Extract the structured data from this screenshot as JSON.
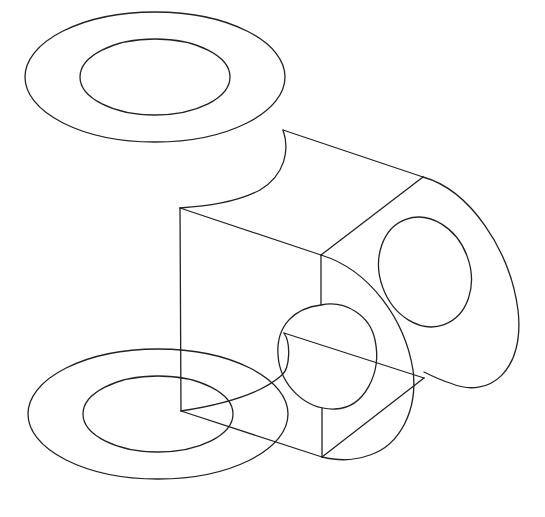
{
  "figure": {
    "type": "isometric-line-drawing",
    "background": "#ffffff",
    "stroke": "#222222"
  },
  "parts": {
    "top_ring": {
      "cx": 155,
      "cy": 77,
      "outer_rx": 130,
      "outer_ry": 65,
      "inner_rx": 75,
      "inner_ry": 38
    },
    "bottom_ring": {
      "cx": 158,
      "cy": 414,
      "outer_rx": 130,
      "outer_ry": 65,
      "inner_rx": 75,
      "inner_ry": 38
    },
    "side_hole": {
      "cx": 425,
      "cy": 272,
      "rx": 45,
      "ry": 56,
      "rotate": -20
    },
    "front_hole": {
      "cx": 334,
      "cy": 354,
      "rx": 52,
      "ry": 57,
      "rotate": -20
    }
  }
}
